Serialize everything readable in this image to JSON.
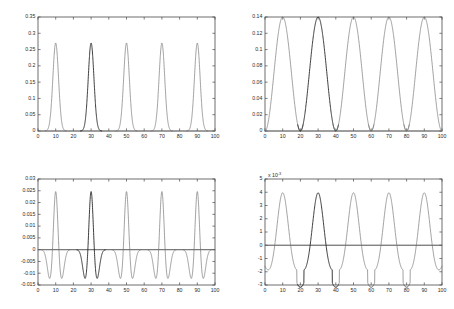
{
  "figure": {
    "background": "#ffffff",
    "curve_color": "#6e6e6e",
    "highlight_color": "#1a1a1a",
    "axis_color": "#4a4a4a",
    "layout": "2x2 subplots"
  },
  "chart_data": [
    {
      "id": "top-left",
      "type": "line",
      "title": "",
      "xlabel": "",
      "ylabel": "",
      "xlim": [
        0,
        100
      ],
      "ylim": [
        0,
        0.35
      ],
      "xticks": [
        0,
        10,
        20,
        30,
        40,
        50,
        60,
        70,
        80,
        90,
        100
      ],
      "xticklabels": [
        "0",
        "10",
        "20",
        "30",
        "40",
        "50",
        "60",
        "70",
        "80",
        "90",
        "100"
      ],
      "yticks": [
        0,
        0.05,
        0.1,
        0.15,
        0.2,
        0.25,
        0.3,
        0.35
      ],
      "yticklabels": [
        "0",
        "0.05",
        "0.1",
        "0.15",
        "0.2",
        "0.25",
        "0.3",
        "0.35"
      ],
      "grid": false,
      "legend": null,
      "exponent_label": "",
      "pulse": {
        "shape": "narrow-gaussian",
        "centers": [
          10,
          30,
          50,
          70,
          90
        ],
        "peak": 0.27,
        "baseline": 0,
        "half_width": 4.5,
        "sigma": 1.6,
        "highlight_index": 1
      },
      "series": [
        {
          "name": "pulse-1",
          "center": 10,
          "peak": 0.27,
          "highlight": false
        },
        {
          "name": "pulse-2",
          "center": 30,
          "peak": 0.272,
          "highlight": true
        },
        {
          "name": "pulse-3",
          "center": 50,
          "peak": 0.27,
          "highlight": false
        },
        {
          "name": "pulse-4",
          "center": 70,
          "peak": 0.27,
          "highlight": false
        },
        {
          "name": "pulse-5",
          "center": 90,
          "peak": 0.271,
          "highlight": false
        }
      ]
    },
    {
      "id": "top-right",
      "type": "line",
      "title": "",
      "xlabel": "",
      "ylabel": "",
      "xlim": [
        0,
        100
      ],
      "ylim": [
        0,
        0.14
      ],
      "xticks": [
        0,
        10,
        20,
        30,
        40,
        50,
        60,
        70,
        80,
        90,
        100
      ],
      "xticklabels": [
        "0",
        "10",
        "20",
        "30",
        "40",
        "50",
        "60",
        "70",
        "80",
        "90",
        "100"
      ],
      "yticks": [
        0,
        0.02,
        0.04,
        0.06,
        0.08,
        0.1,
        0.12,
        0.14
      ],
      "yticklabels": [
        "0",
        "0.02",
        "0.04",
        "0.06",
        "0.08",
        "0.1",
        "0.12",
        "0.14"
      ],
      "grid": false,
      "legend": null,
      "exponent_label": "",
      "pulse": {
        "shape": "raised-cosine",
        "centers": [
          10,
          30,
          50,
          70,
          90
        ],
        "peak": 0.14,
        "baseline": 0,
        "half_width": 10,
        "highlight_index": 1
      },
      "series": [
        {
          "name": "lobe-1",
          "center": 10,
          "peak": 0.14,
          "highlight": false
        },
        {
          "name": "lobe-2",
          "center": 30,
          "peak": 0.14,
          "highlight": true
        },
        {
          "name": "lobe-3",
          "center": 50,
          "peak": 0.14,
          "highlight": false
        },
        {
          "name": "lobe-4",
          "center": 70,
          "peak": 0.14,
          "highlight": false
        },
        {
          "name": "lobe-5",
          "center": 90,
          "peak": 0.14,
          "highlight": false
        }
      ]
    },
    {
      "id": "bottom-left",
      "type": "line",
      "title": "",
      "xlabel": "",
      "ylabel": "",
      "xlim": [
        0,
        100
      ],
      "ylim": [
        -0.015,
        0.03
      ],
      "xticks": [
        0,
        10,
        20,
        30,
        40,
        50,
        60,
        70,
        80,
        90,
        100
      ],
      "xticklabels": [
        "0",
        "10",
        "20",
        "30",
        "40",
        "50",
        "60",
        "70",
        "80",
        "90",
        "100"
      ],
      "yticks": [
        -0.015,
        -0.01,
        -0.005,
        0,
        0.005,
        0.01,
        0.015,
        0.02,
        0.025,
        0.03
      ],
      "yticklabels": [
        "-0.015",
        "-0.01",
        "-0.005",
        "0",
        "0.005",
        "0.01",
        "0.015",
        "0.02",
        "0.025",
        "0.03"
      ],
      "grid": false,
      "legend": null,
      "exponent_label": "",
      "zero_line": true,
      "pulse": {
        "shape": "mexican-hat-narrow",
        "centers": [
          10,
          30,
          50,
          70,
          90
        ],
        "peak": 0.0273,
        "trough": -0.0128,
        "baseline": 0,
        "main_sigma": 1.2,
        "side_offset": 3.2,
        "half_width": 6.5,
        "highlight_index": 1
      },
      "series": [
        {
          "name": "wavelet-1",
          "center": 10,
          "peak": 0.0273,
          "trough": -0.0128,
          "highlight": false
        },
        {
          "name": "wavelet-2",
          "center": 30,
          "peak": 0.0273,
          "trough": -0.013,
          "highlight": true
        },
        {
          "name": "wavelet-3",
          "center": 50,
          "peak": 0.0272,
          "trough": -0.0126,
          "highlight": false
        },
        {
          "name": "wavelet-4",
          "center": 70,
          "peak": 0.0271,
          "trough": -0.0124,
          "highlight": false
        },
        {
          "name": "wavelet-5",
          "center": 90,
          "peak": 0.0273,
          "trough": -0.0128,
          "highlight": false
        }
      ]
    },
    {
      "id": "bottom-right",
      "type": "line",
      "title": "",
      "xlabel": "",
      "ylabel": "",
      "xlim": [
        0,
        100
      ],
      "ylim": [
        -3,
        5
      ],
      "xticks": [
        0,
        10,
        20,
        30,
        40,
        50,
        60,
        70,
        80,
        90,
        100
      ],
      "xticklabels": [
        "0",
        "10",
        "20",
        "30",
        "40",
        "50",
        "60",
        "70",
        "80",
        "90",
        "100"
      ],
      "yticks": [
        -3,
        -2,
        -1,
        0,
        1,
        2,
        3,
        4,
        5
      ],
      "yticklabels": [
        "-3",
        "-2",
        "-1",
        "0",
        "1",
        "2",
        "3",
        "4",
        "5"
      ],
      "grid": false,
      "legend": null,
      "exponent_label": "x 10",
      "exponent_power": "-3",
      "zero_line": true,
      "pulse": {
        "shape": "mexican-hat-wide",
        "centers": [
          10,
          30,
          50,
          70,
          90
        ],
        "peak": 4.5,
        "trough": -2.0,
        "baseline": 0,
        "main_sigma": 3.0,
        "side_offset": 7.5,
        "half_width": 10,
        "highlight_index": 1
      },
      "series": [
        {
          "name": "wavelet-1",
          "center": 10,
          "peak": 4.5,
          "trough": -2.0,
          "highlight": false
        },
        {
          "name": "wavelet-2",
          "center": 30,
          "peak": 4.5,
          "trough": -2.05,
          "highlight": true
        },
        {
          "name": "wavelet-3",
          "center": 50,
          "peak": 4.45,
          "trough": -2.0,
          "highlight": false
        },
        {
          "name": "wavelet-4",
          "center": 70,
          "peak": 4.45,
          "trough": -2.0,
          "highlight": false
        },
        {
          "name": "wavelet-5",
          "center": 90,
          "peak": 4.45,
          "trough": -2.0,
          "highlight": false
        }
      ]
    }
  ]
}
